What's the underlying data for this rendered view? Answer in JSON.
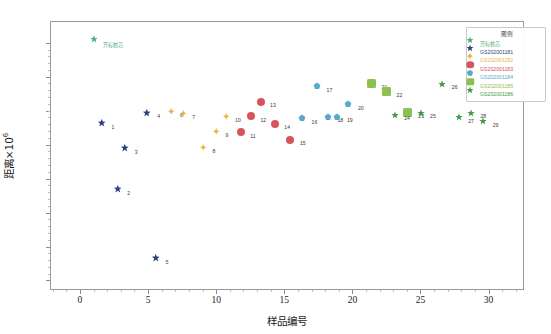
{
  "chart_data": {
    "type": "scatter",
    "title": "",
    "xlabel": "样品编号",
    "ylabel": "距离×10",
    "ylabel_exp": "6",
    "xlim": [
      -2.2,
      32.6
    ],
    "ylim": [
      -1.82,
      0.16
    ],
    "xticks": [
      0,
      5,
      10,
      15,
      20,
      25,
      30
    ],
    "xtick_labels": [
      "0",
      "5",
      "10",
      "15",
      "20",
      "25",
      "30"
    ],
    "yticks": [
      0,
      -0.25,
      -0.5,
      -0.75,
      -1,
      -1.25,
      -1.5,
      -1.75
    ],
    "ytick_labels": [
      "0",
      "−0.25",
      "−0.5",
      "−0.75",
      "−1",
      "−1.25",
      "−1.5",
      "−1.75"
    ],
    "grid": false,
    "legend_position": "upper-right",
    "legend_title": "图例",
    "series": [
      {
        "name": "开标桩芯",
        "color": "#4caf7d",
        "marker": "star",
        "size": 8,
        "points": [
          {
            "x": 1.35,
            "y": 0.0,
            "label": ""
          }
        ]
      },
      {
        "name": "GS202001181",
        "color": "#2f3f7f",
        "marker": "star",
        "size": 8.5,
        "points": [
          {
            "x": 1.9,
            "y": -0.622,
            "label": "1"
          },
          {
            "x": 3.05,
            "y": -1.108,
            "label": "2"
          },
          {
            "x": 3.6,
            "y": -0.806,
            "label": "3"
          },
          {
            "x": 5.25,
            "y": -0.545,
            "label": "4"
          },
          {
            "x": 5.85,
            "y": -1.617,
            "label": "5"
          }
        ]
      },
      {
        "name": "GS202001182",
        "color": "#efb344",
        "marker": "diamond",
        "size": 7.5,
        "points": [
          {
            "x": 6.95,
            "y": -0.532,
            "label": "6"
          },
          {
            "x": 7.85,
            "y": -0.548,
            "label": "7"
          },
          {
            "x": 9.35,
            "y": -0.8,
            "label": "8"
          },
          {
            "x": 10.3,
            "y": -0.682,
            "label": "9"
          },
          {
            "x": 11.0,
            "y": -0.57,
            "label": "10"
          }
        ]
      },
      {
        "name": "GS202001183",
        "color": "#d8545a",
        "marker": "circle",
        "size": 8,
        "points": [
          {
            "x": 12.1,
            "y": -0.69,
            "label": "11"
          },
          {
            "x": 12.85,
            "y": -0.57,
            "label": "12"
          },
          {
            "x": 13.55,
            "y": -0.463,
            "label": "13"
          },
          {
            "x": 14.6,
            "y": -0.627,
            "label": "14"
          },
          {
            "x": 15.75,
            "y": -0.742,
            "label": "15"
          }
        ]
      },
      {
        "name": "GS202001184",
        "color": "#5aa8cf",
        "marker": "pentagon",
        "size": 8,
        "points": [
          {
            "x": 16.6,
            "y": -0.586,
            "label": "16"
          },
          {
            "x": 17.7,
            "y": -0.348,
            "label": "17"
          },
          {
            "x": 18.5,
            "y": -0.573,
            "label": "18"
          },
          {
            "x": 19.2,
            "y": -0.573,
            "label": "19"
          },
          {
            "x": 20.0,
            "y": -0.483,
            "label": "20"
          }
        ]
      },
      {
        "name": "GS202001185",
        "color": "#8cc152",
        "marker": "square",
        "size": 9,
        "points": [
          {
            "x": 21.7,
            "y": -0.33,
            "label": "21"
          },
          {
            "x": 22.8,
            "y": -0.39,
            "label": "22"
          },
          {
            "x": 24.4,
            "y": -0.545,
            "label": "23"
          }
        ]
      },
      {
        "name": "GS202001186",
        "color": "#3f9b44",
        "marker": "star",
        "size": 8,
        "points": [
          {
            "x": 23.4,
            "y": -0.56,
            "label": "24"
          },
          {
            "x": 25.3,
            "y": -0.545,
            "label": "25"
          },
          {
            "x": 26.9,
            "y": -0.333,
            "label": "26"
          },
          {
            "x": 28.1,
            "y": -0.578,
            "label": "27"
          },
          {
            "x": 29.0,
            "y": -0.545,
            "label": "28"
          },
          {
            "x": 29.9,
            "y": -0.608,
            "label": "29"
          }
        ]
      }
    ]
  },
  "legend": {
    "title": "图例",
    "items": [
      {
        "label": "开标桩芯",
        "color": "#4caf7d",
        "marker": "star"
      },
      {
        "label": "GS202001181",
        "color": "#2f3f7f",
        "marker": "star"
      },
      {
        "label": "GS202001182",
        "color": "#efb344",
        "marker": "diamond"
      },
      {
        "label": "GS202001183",
        "color": "#d8545a",
        "marker": "circle"
      },
      {
        "label": "GS202001184",
        "color": "#5aa8cf",
        "marker": "pentagon"
      },
      {
        "label": "GS202001185",
        "color": "#8cc152",
        "marker": "square"
      },
      {
        "label": "GS202001186",
        "color": "#3f9b44",
        "marker": "star"
      }
    ]
  },
  "annotations": {
    "ref_point_text": "开标桩芯"
  }
}
